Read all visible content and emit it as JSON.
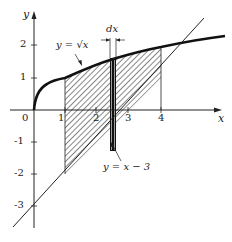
{
  "diagram": {
    "axes": {
      "x_label": "x",
      "y_label": "y",
      "origin_label": "0",
      "x_ticks": [
        "1",
        "2",
        "3",
        "4"
      ],
      "y_ticks_positive": [
        "1",
        "2"
      ],
      "y_ticks_negative": [
        "-1",
        "-2",
        "-3"
      ]
    },
    "curves": {
      "sqrt_label": "y = √x",
      "line_label": "y = x − 3"
    },
    "strip_label": "dx",
    "shaded_region": {
      "x_from": 1,
      "x_to": 4
    },
    "colors": {
      "ink": "#1a1a1a",
      "background": "#ffffff"
    }
  }
}
